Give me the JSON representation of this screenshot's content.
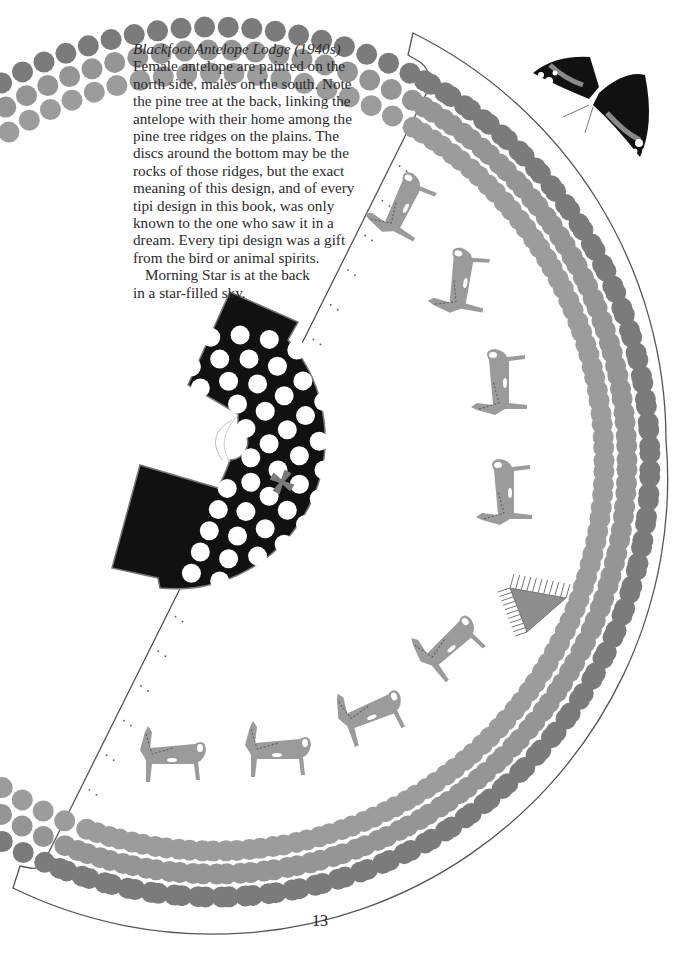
{
  "caption": {
    "title": "Blackfoot Antelope Lodge (1940s)",
    "lines": [
      "Female antelope are painted on the",
      "north side, males on the south. Note",
      "the pine tree at the back, linking the",
      "antelope with their home among the",
      "pine tree ridges on the plains. The",
      "discs around the bottom may be the",
      "rocks of those ridges, but the exact",
      "meaning of this design, and of every",
      "tipi design in this book, was only",
      "known to the one who saw it in a",
      "dream. Every tipi design was a gift",
      "from the bird or animal spirits."
    ],
    "para2_lines": [
      "Morning Star is at the back",
      "in a star-filled sky."
    ]
  },
  "page_number": "13",
  "illustration": {
    "subject": "tipi-cover-template",
    "outline_color": "#555555",
    "center": [
      215,
      462
    ],
    "outer_radius": 455,
    "disc_rings": [
      {
        "radius": 435,
        "color": "#7b7b7b",
        "disc_r": 10.5
      },
      {
        "radius": 412,
        "color": "#959595",
        "disc_r": 10.5
      },
      {
        "radius": 389,
        "color": "#9c9c9c",
        "disc_r": 10.5
      }
    ],
    "antelopes": {
      "color": "#9b9b9b",
      "count": 8,
      "positions": [
        [
          405,
          210,
          -62
        ],
        [
          465,
          285,
          -80
        ],
        [
          505,
          385,
          -90
        ],
        [
          510,
          495,
          -90
        ],
        [
          450,
          650,
          -40
        ],
        [
          370,
          718,
          -20
        ],
        [
          275,
          755,
          0
        ],
        [
          170,
          760,
          0
        ]
      ]
    },
    "pine_tree": {
      "color": "#8e8e8e"
    },
    "smoke_flap": {
      "fill": "#111111",
      "disc_color": "#ffffff",
      "star_color": "#7a7a7a"
    },
    "butterfly": {
      "wing_color": "#111111",
      "band_color": "#8a8a8a",
      "spot_color": "#ffffff"
    }
  }
}
